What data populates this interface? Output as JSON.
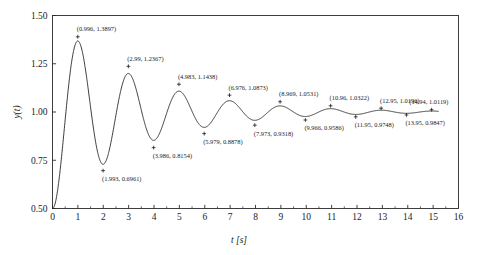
{
  "chart_data": {
    "type": "line",
    "title": "",
    "xlabel": "t [s]",
    "ylabel": "y(t)",
    "xlim": [
      0,
      16
    ],
    "ylim": [
      0.5,
      1.5
    ],
    "xticks": [
      0,
      1,
      2,
      3,
      4,
      5,
      6,
      7,
      8,
      9,
      10,
      11,
      12,
      13,
      14,
      15,
      16
    ],
    "xticklabels": [
      "0",
      "1",
      "2",
      "3",
      "4",
      "5",
      "6",
      "7",
      "8",
      "9",
      "10",
      "11",
      "12",
      "13",
      "14",
      "15",
      "16"
    ],
    "yticks": [
      0.5,
      0.75,
      1.0,
      1.25,
      1.5
    ],
    "yticklabels": [
      "0.50",
      "0.75",
      "1.00",
      "1.25",
      "1.50"
    ],
    "minor_tick_step": 0.5,
    "grid": false,
    "legend": null,
    "series": [
      {
        "name": "y(t)",
        "description": "damped oscillatory step response settling to 1",
        "start_point": [
          0,
          0.5
        ],
        "end_point": [
          15.2,
          1.0095
        ],
        "steady_state": 1.0,
        "model": "y(t) = 1 - 0.5*exp(-a*t)*(cos(w*t) + (a/w)*sin(w*t))",
        "params": {
          "a": 0.3072,
          "w": 3.1528,
          "y0": 0.5
        }
      }
    ],
    "extrema": [
      {
        "kind": "max",
        "x": 0.996,
        "y": 1.3897,
        "label": "(0.996, 1.3897)"
      },
      {
        "kind": "min",
        "x": 1.993,
        "y": 0.6961,
        "label": "(1.993, 0.6961)"
      },
      {
        "kind": "max",
        "x": 2.99,
        "y": 1.2367,
        "label": "(2.99, 1.2367)"
      },
      {
        "kind": "min",
        "x": 3.986,
        "y": 0.8154,
        "label": "(3.986, 0.8154)"
      },
      {
        "kind": "max",
        "x": 4.983,
        "y": 1.1438,
        "label": "(4.983, 1.1438)"
      },
      {
        "kind": "min",
        "x": 5.979,
        "y": 0.8878,
        "label": "(5.979, 0.8878)"
      },
      {
        "kind": "max",
        "x": 6.976,
        "y": 1.0873,
        "label": "(6.976, 1.0873)"
      },
      {
        "kind": "min",
        "x": 7.973,
        "y": 0.9318,
        "label": "(7.973, 0.9318)"
      },
      {
        "kind": "max",
        "x": 8.969,
        "y": 1.0531,
        "label": "(8.969, 1.0531)"
      },
      {
        "kind": "min",
        "x": 9.966,
        "y": 0.9586,
        "label": "(9.966, 0.9586)"
      },
      {
        "kind": "max",
        "x": 10.96,
        "y": 1.0322,
        "label": "(10.96, 1.0322)"
      },
      {
        "kind": "min",
        "x": 11.95,
        "y": 0.9748,
        "label": "(11.95, 0.9748)"
      },
      {
        "kind": "max",
        "x": 12.95,
        "y": 1.0196,
        "label": "(12.95, 1.0196)"
      },
      {
        "kind": "min",
        "x": 13.95,
        "y": 0.9847,
        "label": "(13.95, 0.9847)"
      },
      {
        "kind": "max",
        "x": 14.94,
        "y": 1.0119,
        "label": "(14.94, 1.0119)"
      }
    ]
  },
  "colors": {
    "curve": "#1a1a1a",
    "axis": "#2b2b2b",
    "background": "#ffffff"
  }
}
